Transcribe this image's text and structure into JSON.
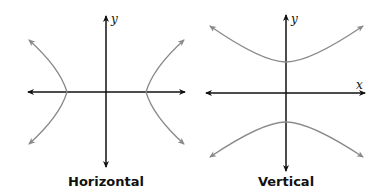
{
  "colors": {
    "axis": "#111111",
    "curve": "#8a8a8a",
    "background": "#ffffff"
  },
  "panels": [
    {
      "caption": "Horizontal",
      "axis_labels": {
        "y": "y"
      },
      "orientation": "horizontal",
      "description": "Hyperbola opening left and right, vertices on x-axis"
    },
    {
      "caption": "Vertical",
      "axis_labels": {
        "y": "y",
        "x": "x"
      },
      "orientation": "vertical",
      "description": "Hyperbola opening up and down, vertices on y-axis"
    }
  ]
}
